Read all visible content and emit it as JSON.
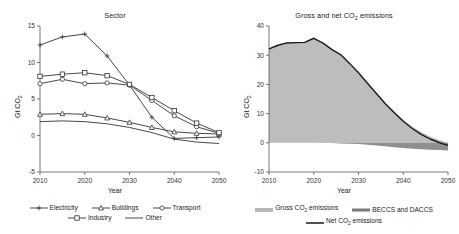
{
  "figure": {
    "width": 459,
    "height": 234,
    "background": "#ffffff"
  },
  "panels": {
    "left": {
      "title": "Sector",
      "xlabel": "Year",
      "ylabel_prefix": "Gt CO",
      "ylabel_sub": "2",
      "legend": [
        {
          "label": "Electricity",
          "marker": "plus-marker",
          "color": "#333333"
        },
        {
          "label": "Buildings",
          "marker": "triangle-marker",
          "color": "#333333"
        },
        {
          "label": "Transport",
          "marker": "circle-marker",
          "color": "#333333"
        },
        {
          "label": "Industry",
          "marker": "square-marker",
          "color": "#333333"
        },
        {
          "label": "Other",
          "marker": "line-marker",
          "color": "#333333"
        }
      ]
    },
    "right": {
      "title_prefix": "Gross and net CO",
      "title_sub": "2",
      "title_suffix": " emissions",
      "xlabel": "Year",
      "ylabel_prefix": "Gt CO",
      "ylabel_sub": "2",
      "legend": [
        {
          "label_prefix": "Gross CO",
          "label_sub": "2",
          "label_suffix": " emissions",
          "swatch": "area-fill-swatch",
          "color": "#b8b8b8"
        },
        {
          "label_prefix": "BECCS and DACCS",
          "label_sub": "",
          "label_suffix": "",
          "swatch": "dark-band-swatch",
          "color": "#7a7a7a"
        },
        {
          "label_prefix": "Net CO",
          "label_sub": "2",
          "label_suffix": " emissions",
          "swatch": "solid-line-swatch",
          "color": "#1a1a1a"
        }
      ]
    }
  },
  "chart_data": [
    {
      "id": "sector-chart",
      "type": "line",
      "title": "Sector",
      "xlabel": "Year",
      "ylabel": "Gt CO2",
      "xlim": [
        2010,
        2050
      ],
      "ylim": [
        -5,
        15
      ],
      "xticks": [
        2010,
        2020,
        2030,
        2040,
        2050
      ],
      "yticks": [
        -5,
        0,
        5,
        10,
        15
      ],
      "grid": false,
      "legend_position": "below",
      "x": [
        2010,
        2015,
        2020,
        2025,
        2030,
        2035,
        2040,
        2045,
        2050
      ],
      "series": [
        {
          "name": "Electricity",
          "marker": "plus",
          "values": [
            12.4,
            13.5,
            13.9,
            10.9,
            6.9,
            2.5,
            -0.4,
            -0.3,
            -0.2
          ]
        },
        {
          "name": "Buildings",
          "marker": "triangle",
          "values": [
            2.9,
            3.0,
            2.9,
            2.4,
            1.8,
            1.1,
            0.5,
            0.3,
            0.2
          ]
        },
        {
          "name": "Transport",
          "marker": "circle",
          "values": [
            7.1,
            7.7,
            7.1,
            7.2,
            6.9,
            4.8,
            2.7,
            1.2,
            0.3
          ]
        },
        {
          "name": "Industry",
          "marker": "square",
          "values": [
            8.1,
            8.4,
            8.6,
            8.2,
            7.0,
            5.2,
            3.4,
            1.7,
            0.4
          ]
        },
        {
          "name": "Other",
          "marker": "none",
          "values": [
            1.9,
            2.0,
            1.9,
            1.6,
            1.1,
            0.4,
            -0.5,
            -0.9,
            -1.1
          ]
        }
      ]
    },
    {
      "id": "gross-net-chart",
      "type": "area",
      "title": "Gross and net CO2 emissions",
      "xlabel": "Year",
      "ylabel": "Gt CO2",
      "xlim": [
        2010,
        2050
      ],
      "ylim": [
        -10,
        40
      ],
      "xticks": [
        2010,
        2020,
        2030,
        2040,
        2050
      ],
      "yticks": [
        -10,
        0,
        10,
        20,
        30,
        40
      ],
      "grid": false,
      "legend_position": "below",
      "x": [
        2010,
        2012,
        2014,
        2016,
        2018,
        2020,
        2022,
        2024,
        2026,
        2028,
        2030,
        2032,
        2034,
        2036,
        2038,
        2040,
        2042,
        2044,
        2046,
        2048,
        2050
      ],
      "series": [
        {
          "name": "Gross CO2 emissions",
          "type": "area",
          "values": [
            32.2,
            33.4,
            34.2,
            34.3,
            34.4,
            35.8,
            34.2,
            32.0,
            30.2,
            27.2,
            24.0,
            20.5,
            17.0,
            13.6,
            10.6,
            7.9,
            5.6,
            3.7,
            2.2,
            1.0,
            0.1
          ]
        },
        {
          "name": "BECCS and DACCS",
          "type": "area-negative",
          "values": [
            0.0,
            0.0,
            0.0,
            0.0,
            0.0,
            0.0,
            -0.05,
            -0.1,
            -0.2,
            -0.3,
            -0.45,
            -0.7,
            -0.95,
            -1.2,
            -1.5,
            -1.75,
            -2.0,
            -2.2,
            -2.4,
            -2.5,
            -2.6
          ]
        },
        {
          "name": "Net CO2 emissions",
          "type": "line",
          "values": [
            32.2,
            33.4,
            34.2,
            34.3,
            34.4,
            35.8,
            34.2,
            32.0,
            30.2,
            27.2,
            24.0,
            20.4,
            16.9,
            13.4,
            10.3,
            7.4,
            4.9,
            2.9,
            1.3,
            0.1,
            -0.9
          ]
        }
      ]
    }
  ]
}
